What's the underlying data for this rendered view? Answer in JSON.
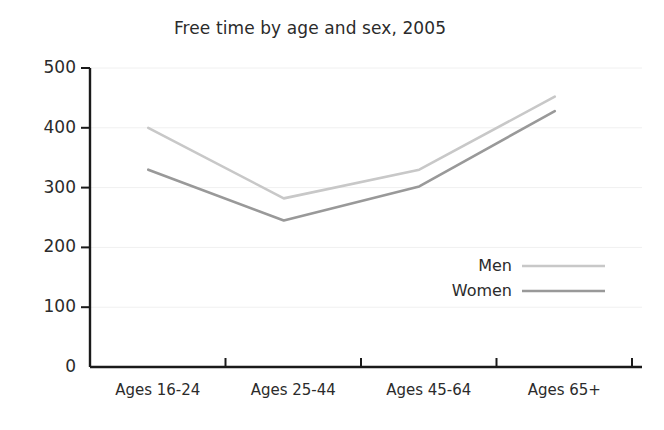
{
  "chart_data": {
    "type": "line",
    "title": "Free time by age and sex, 2005",
    "xlabel": "",
    "ylabel": "",
    "categories": [
      "Ages 16-24",
      "Ages 25-44",
      "Ages 45-64",
      "Ages 65+"
    ],
    "series": [
      {
        "name": "Men",
        "values": [
          400,
          282,
          330,
          452
        ],
        "color": "#c8c8c8"
      },
      {
        "name": "Women",
        "values": [
          330,
          245,
          302,
          428
        ],
        "color": "#999999"
      }
    ],
    "ylim": [
      0,
      500
    ],
    "yticks": [
      0,
      100,
      200,
      300,
      400,
      500
    ],
    "ytick_labels": [
      "0",
      "100",
      "200",
      "300",
      "400",
      "500"
    ],
    "grid": true,
    "grid_color": "#f0f0f0",
    "axis_color": "#1a1a1a",
    "legend": {
      "position": "inside-right",
      "entries": [
        {
          "label": "Men",
          "color": "#c8c8c8"
        },
        {
          "label": "Women",
          "color": "#999999"
        }
      ]
    }
  }
}
